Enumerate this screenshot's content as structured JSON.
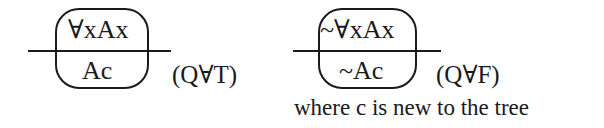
{
  "rules": [
    {
      "name": "universal-true",
      "premise": "∀xAx",
      "conclusion": "Ac",
      "label": "(Q∀T)"
    },
    {
      "name": "universal-false",
      "premise": "~∀xAx",
      "conclusion": "~Ac",
      "label": "(Q∀F)",
      "note": "where c is new to the tree"
    }
  ],
  "colors": {
    "ink": "#1a1a1a",
    "background": "#ffffff"
  }
}
